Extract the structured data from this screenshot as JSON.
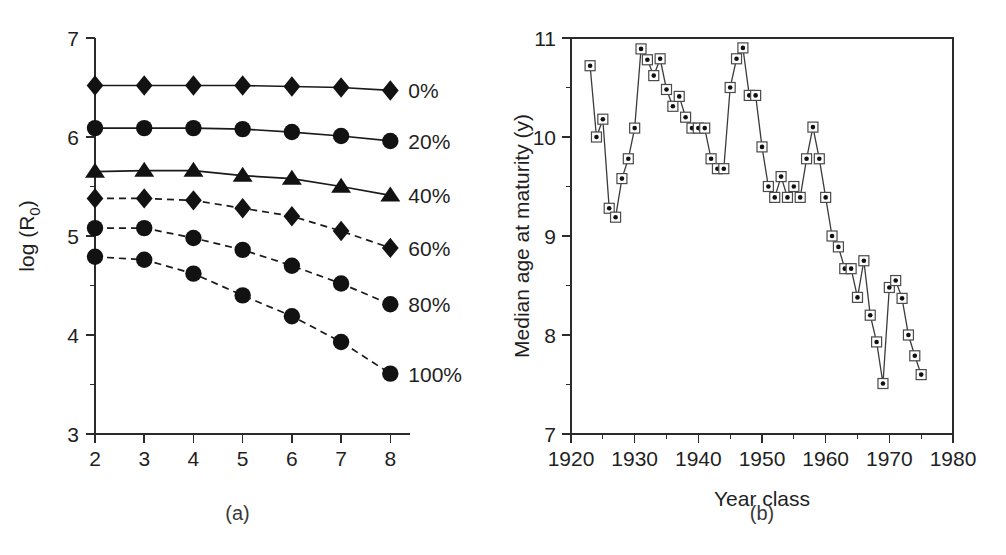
{
  "figure": {
    "panel_a_caption": "(a)",
    "panel_b_caption": "(b)"
  },
  "chart_data": [
    {
      "type": "line",
      "panel": "(a)",
      "title": "",
      "xlabel": "",
      "ylabel": "log (R0)",
      "ylabel_base": "log (R",
      "ylabel_sub": "0",
      "ylabel_close": ")",
      "xlim": [
        2,
        8.4
      ],
      "ylim": [
        3,
        7
      ],
      "xticks": [
        2,
        3,
        4,
        5,
        6,
        7,
        8
      ],
      "xticklabels": [
        "2",
        "3",
        "4",
        "5",
        "6",
        "7",
        "8"
      ],
      "yticks": [
        3,
        4,
        5,
        6,
        7
      ],
      "yticklabels": [
        "3",
        "4",
        "5",
        "6",
        "7"
      ],
      "y_minor_ticks": [
        3.5,
        4.5,
        5.5,
        6.5
      ],
      "grid": false,
      "legend_position": "right-of-axes",
      "x": [
        2,
        3,
        4,
        5,
        6,
        7,
        8
      ],
      "series": [
        {
          "name": "0%",
          "label": "0%",
          "marker": "diamond",
          "linestyle": "solid",
          "values": [
            6.52,
            6.52,
            6.52,
            6.52,
            6.51,
            6.5,
            6.47
          ]
        },
        {
          "name": "20%",
          "label": "20%",
          "marker": "circle",
          "linestyle": "solid",
          "values": [
            6.09,
            6.09,
            6.09,
            6.08,
            6.05,
            6.01,
            5.96
          ]
        },
        {
          "name": "40%",
          "label": "40%",
          "marker": "triangle",
          "linestyle": "solid",
          "values": [
            5.65,
            5.66,
            5.66,
            5.61,
            5.58,
            5.5,
            5.41
          ]
        },
        {
          "name": "60%",
          "label": "60%",
          "marker": "diamond",
          "linestyle": "dashed",
          "values": [
            5.38,
            5.38,
            5.36,
            5.28,
            5.2,
            5.05,
            4.88
          ]
        },
        {
          "name": "80%",
          "label": "80%",
          "marker": "circle",
          "linestyle": "dashed",
          "values": [
            5.08,
            5.08,
            4.98,
            4.86,
            4.7,
            4.52,
            4.31
          ]
        },
        {
          "name": "100%",
          "label": "100%",
          "marker": "circle",
          "linestyle": "dashed",
          "values": [
            4.79,
            4.76,
            4.62,
            4.4,
            4.19,
            3.93,
            3.61
          ]
        }
      ]
    },
    {
      "type": "line",
      "panel": "(b)",
      "title": "",
      "xlabel": "Year class",
      "ylabel": "Median age at maturity (y)",
      "xlim": [
        1920,
        1980
      ],
      "ylim": [
        7,
        11
      ],
      "xticks": [
        1920,
        1930,
        1940,
        1950,
        1960,
        1970,
        1980
      ],
      "xticklabels": [
        "1920",
        "1930",
        "1940",
        "1950",
        "1960",
        "1970",
        "1980"
      ],
      "x_minor_ticks": [
        1925,
        1935,
        1945,
        1955,
        1965,
        1975
      ],
      "yticks": [
        7,
        8,
        9,
        10,
        11
      ],
      "yticklabels": [
        "7",
        "8",
        "9",
        "10",
        "11"
      ],
      "y_minor_ticks": [
        7.5,
        8.5,
        9.5,
        10.5
      ],
      "grid": false,
      "marker": "square-with-dot",
      "x": [
        1923,
        1924,
        1925,
        1926,
        1927,
        1928,
        1929,
        1930,
        1931,
        1932,
        1933,
        1934,
        1935,
        1936,
        1937,
        1938,
        1939,
        1940,
        1941,
        1942,
        1943,
        1944,
        1945,
        1946,
        1947,
        1948,
        1949,
        1950,
        1951,
        1952,
        1953,
        1954,
        1955,
        1956,
        1957,
        1958,
        1959,
        1960,
        1961,
        1962,
        1963,
        1964,
        1965,
        1966,
        1967,
        1968,
        1969,
        1970,
        1971,
        1972,
        1973,
        1974,
        1975
      ],
      "values": [
        10.72,
        10.0,
        10.18,
        9.28,
        9.19,
        9.58,
        9.78,
        10.09,
        10.89,
        10.78,
        10.62,
        10.79,
        10.48,
        10.31,
        10.41,
        10.2,
        10.09,
        10.09,
        10.09,
        9.78,
        9.68,
        9.68,
        10.5,
        10.79,
        10.9,
        10.42,
        10.42,
        9.9,
        9.5,
        9.39,
        9.6,
        9.39,
        9.5,
        9.39,
        9.78,
        10.1,
        9.78,
        9.39,
        9.0,
        8.89,
        8.67,
        8.67,
        8.38,
        8.75,
        8.2,
        7.93,
        7.51,
        8.48,
        8.55,
        8.37,
        8.0,
        7.79,
        7.6
      ]
    }
  ]
}
